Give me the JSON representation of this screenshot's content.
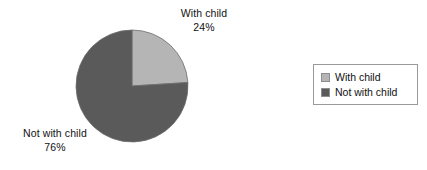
{
  "chart_data": {
    "type": "pie",
    "title": "",
    "categories": [
      "With child",
      "Not with child"
    ],
    "values": [
      24,
      76
    ],
    "value_unit": "%",
    "slices": [
      {
        "label": "With child",
        "value": 24,
        "value_label": "24%",
        "color": "#b5b5b5",
        "start_angle_deg": 0,
        "end_angle_deg": 86.4
      },
      {
        "label": "Not with child",
        "value": 76,
        "value_label": "76%",
        "color": "#5a5a5a",
        "start_angle_deg": 86.4,
        "end_angle_deg": 360
      }
    ],
    "start_angle_deg": 0,
    "direction": "clockwise",
    "labels_outside": true,
    "legend_position": "right",
    "background_color": "#ffffff",
    "text_color": "#111111",
    "border_color": "#9a9a9a"
  },
  "callouts": [
    {
      "name": "With child",
      "value_label": "24%"
    },
    {
      "name": "Not with child",
      "value_label": "76%"
    }
  ],
  "legend": {
    "items": [
      {
        "label": "With child",
        "color": "#b5b5b5"
      },
      {
        "label": "Not with child",
        "color": "#5a5a5a"
      }
    ]
  }
}
